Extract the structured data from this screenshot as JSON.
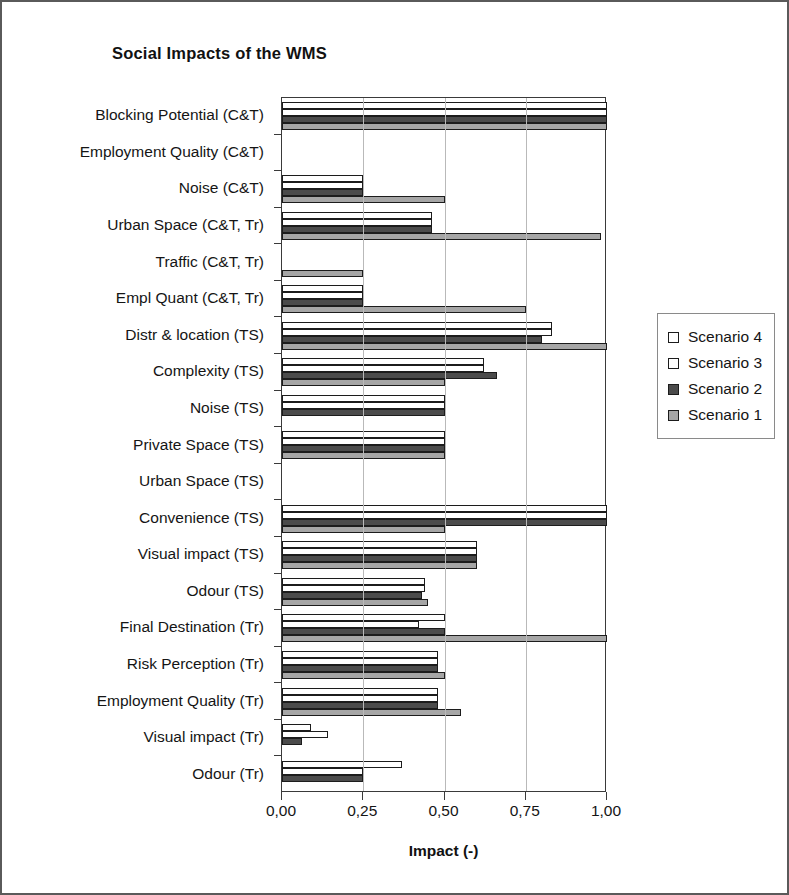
{
  "chart_data": {
    "type": "bar",
    "orientation": "horizontal",
    "title": "Social Impacts of the WMS",
    "xlabel": "Impact (-)",
    "ylabel": "",
    "xlim": [
      0,
      1
    ],
    "xticks": [
      0,
      0.25,
      0.5,
      0.75,
      1
    ],
    "xtick_labels": [
      "0,00",
      "0,25",
      "0,50",
      "0,75",
      "1,00"
    ],
    "grid": "vertical",
    "legend_position": "right",
    "categories": [
      "Blocking Potential (C&T)",
      "Employment  Quality (C&T)",
      "Noise (C&T)",
      "Urban Space (C&T, Tr)",
      "Traffic (C&T, Tr)",
      "Empl Quant (C&T, Tr)",
      "Distr & location (TS)",
      "Complexity (TS)",
      "Noise (TS)",
      "Private Space (TS)",
      "Urban Space (TS)",
      "Convenience (TS)",
      "Visual impact (TS)",
      "Odour (TS)",
      "Final Destination (Tr)",
      "Risk Perception (Tr)",
      "Employment Quality (Tr)",
      "Visual impact (Tr)",
      "Odour (Tr)"
    ],
    "series": [
      {
        "name": "Scenario 4",
        "color": "#ffffff",
        "values": [
          1.0,
          0.0,
          0.25,
          0.46,
          0.0,
          0.25,
          0.83,
          0.62,
          0.5,
          0.5,
          0.0,
          1.0,
          0.6,
          0.44,
          0.5,
          0.48,
          0.48,
          0.09,
          0.37
        ]
      },
      {
        "name": "Scenario 3",
        "color": "#ffffff",
        "values": [
          1.0,
          0.0,
          0.25,
          0.46,
          0.0,
          0.25,
          0.83,
          0.62,
          0.5,
          0.5,
          0.0,
          1.0,
          0.6,
          0.44,
          0.42,
          0.48,
          0.48,
          0.14,
          0.25
        ]
      },
      {
        "name": "Scenario 2",
        "color": "#4b4b4b",
        "values": [
          1.0,
          0.0,
          0.25,
          0.46,
          0.0,
          0.25,
          0.8,
          0.66,
          0.5,
          0.5,
          0.0,
          1.0,
          0.6,
          0.43,
          0.5,
          0.48,
          0.48,
          0.06,
          0.25
        ]
      },
      {
        "name": "Scenario 1",
        "color": "#a6a6a6",
        "values": [
          1.0,
          0.0,
          0.5,
          0.98,
          0.25,
          0.75,
          1.0,
          0.5,
          0.0,
          0.5,
          0.0,
          0.5,
          0.6,
          0.45,
          1.0,
          0.5,
          0.55,
          0.0,
          0.0
        ]
      }
    ]
  },
  "legend": {
    "entries": [
      {
        "label": "Scenario 4",
        "color": "#ffffff"
      },
      {
        "label": "Scenario 3",
        "color": "#ffffff"
      },
      {
        "label": "Scenario 2",
        "color": "#4b4b4b"
      },
      {
        "label": "Scenario 1",
        "color": "#a6a6a6"
      }
    ]
  }
}
